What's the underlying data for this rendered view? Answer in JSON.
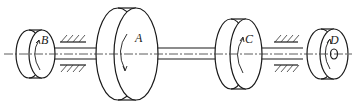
{
  "figure": {
    "type": "mechanical-shaft-diagram",
    "disks": [
      {
        "id": "B",
        "label": "B",
        "position": "far-left",
        "size": "small"
      },
      {
        "id": "A",
        "label": "A",
        "position": "center-left",
        "size": "large"
      },
      {
        "id": "C",
        "label": "C",
        "position": "center-right",
        "size": "medium"
      },
      {
        "id": "D",
        "label": "D",
        "position": "far-right",
        "size": "small"
      }
    ],
    "supports": [
      {
        "id": "bearing-left",
        "between": [
          "B",
          "A"
        ]
      },
      {
        "id": "bearing-right",
        "between": [
          "C",
          "D"
        ]
      }
    ]
  },
  "colors": {
    "line": "#1a1a1a",
    "background": "#ffffff"
  }
}
